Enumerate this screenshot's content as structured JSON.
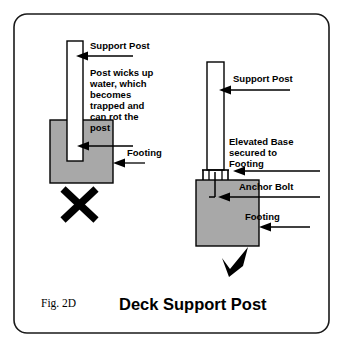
{
  "figure": {
    "caption_id": "Fig. 2D",
    "title": "Deck Support Post",
    "border_color": "#1a1a1a",
    "concrete_color": "#a8a8a8",
    "line_color": "#000000"
  },
  "bad_example": {
    "verdict_mark": "✗",
    "labels": {
      "support_post": "Support Post",
      "footing": "Footing"
    },
    "note_lines": [
      "Post wicks up",
      "water, which",
      "becomes",
      "trapped and",
      "can rot the",
      "post"
    ]
  },
  "good_example": {
    "verdict_mark": "✔",
    "labels": {
      "support_post": "Support Post",
      "anchor_bolt": "Anchor Bolt",
      "footing": "Footing"
    },
    "elevated_base_lines": [
      "Elevated Base",
      "secured to",
      "Footing"
    ]
  }
}
